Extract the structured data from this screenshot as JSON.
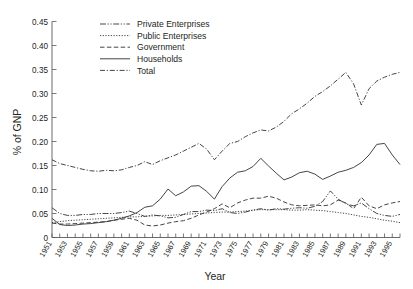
{
  "chart_data": {
    "type": "line",
    "title": "",
    "xlabel": "Year",
    "ylabel": "% of GNP",
    "xlim": [
      1951,
      1996
    ],
    "ylim": [
      0,
      0.45
    ],
    "grid": false,
    "legend_position": "top-left",
    "ytick_labels": [
      "0",
      "0.05",
      "0.10",
      "0.15",
      "0.20",
      "0.25",
      "0.30",
      "0.35",
      "0.40",
      "0.45"
    ],
    "ytick_values": [
      0,
      0.05,
      0.1,
      0.15,
      0.2,
      0.25,
      0.3,
      0.35,
      0.4,
      0.45
    ],
    "xtick_labels": [
      "1951",
      "1953",
      "1955",
      "1957",
      "1959",
      "1961",
      "1963",
      "1965",
      "1967",
      "1969",
      "1971",
      "1973",
      "1975",
      "1977",
      "1979",
      "1981",
      "1983",
      "1985",
      "1987",
      "1989",
      "1991",
      "1993",
      "1995"
    ],
    "xtick_values": [
      1951,
      1953,
      1955,
      1957,
      1959,
      1961,
      1963,
      1965,
      1967,
      1969,
      1971,
      1973,
      1975,
      1977,
      1979,
      1981,
      1983,
      1985,
      1987,
      1989,
      1991,
      1993,
      1995
    ],
    "x": [
      1951,
      1952,
      1953,
      1954,
      1955,
      1956,
      1957,
      1958,
      1959,
      1960,
      1961,
      1962,
      1963,
      1964,
      1965,
      1966,
      1967,
      1968,
      1969,
      1970,
      1971,
      1972,
      1973,
      1974,
      1975,
      1976,
      1977,
      1978,
      1979,
      1980,
      1981,
      1982,
      1983,
      1984,
      1985,
      1986,
      1987,
      1988,
      1989,
      1990,
      1991,
      1992,
      1993,
      1994,
      1995,
      1996
    ],
    "series": [
      {
        "name": "Private Enterprises",
        "dash": "6,1.6,1.2,1.6,1.2,1.6",
        "values": [
          0.062,
          0.05,
          0.046,
          0.046,
          0.048,
          0.048,
          0.05,
          0.05,
          0.05,
          0.052,
          0.055,
          0.05,
          0.044,
          0.047,
          0.045,
          0.041,
          0.042,
          0.048,
          0.054,
          0.054,
          0.057,
          0.056,
          0.06,
          0.052,
          0.05,
          0.053,
          0.057,
          0.06,
          0.057,
          0.06,
          0.059,
          0.061,
          0.062,
          0.061,
          0.065,
          0.075,
          0.097,
          0.08,
          0.07,
          0.066,
          0.072,
          0.06,
          0.05,
          0.046,
          0.044,
          0.048
        ]
      },
      {
        "name": "Public Enterprises",
        "dash": "1.2,1.5",
        "values": [
          0.031,
          0.033,
          0.035,
          0.036,
          0.037,
          0.038,
          0.039,
          0.04,
          0.041,
          0.042,
          0.043,
          0.043,
          0.044,
          0.045,
          0.046,
          0.046,
          0.047,
          0.048,
          0.049,
          0.05,
          0.051,
          0.052,
          0.053,
          0.053,
          0.054,
          0.055,
          0.057,
          0.058,
          0.058,
          0.058,
          0.058,
          0.057,
          0.057,
          0.058,
          0.057,
          0.056,
          0.054,
          0.052,
          0.05,
          0.047,
          0.044,
          0.042,
          0.039,
          0.036,
          0.034,
          0.031
        ]
      },
      {
        "name": "Government",
        "dash": "4.5,2.4",
        "values": [
          0.03,
          0.028,
          0.028,
          0.029,
          0.03,
          0.031,
          0.032,
          0.033,
          0.036,
          0.038,
          0.04,
          0.036,
          0.026,
          0.024,
          0.026,
          0.03,
          0.033,
          0.035,
          0.04,
          0.047,
          0.053,
          0.06,
          0.07,
          0.062,
          0.072,
          0.078,
          0.082,
          0.082,
          0.086,
          0.082,
          0.074,
          0.068,
          0.066,
          0.067,
          0.068,
          0.066,
          0.068,
          0.078,
          0.072,
          0.06,
          0.084,
          0.066,
          0.06,
          0.068,
          0.072,
          0.075
        ]
      },
      {
        "name": "Households",
        "dash": "",
        "values": [
          0.04,
          0.027,
          0.025,
          0.026,
          0.028,
          0.029,
          0.031,
          0.033,
          0.036,
          0.04,
          0.045,
          0.052,
          0.063,
          0.066,
          0.08,
          0.101,
          0.087,
          0.095,
          0.107,
          0.108,
          0.096,
          0.08,
          0.106,
          0.124,
          0.136,
          0.139,
          0.148,
          0.165,
          0.149,
          0.134,
          0.12,
          0.126,
          0.135,
          0.138,
          0.132,
          0.121,
          0.128,
          0.136,
          0.14,
          0.146,
          0.156,
          0.172,
          0.194,
          0.196,
          0.172,
          0.152
        ]
      },
      {
        "name": "Total",
        "dash": "5,1.8,1.2,1.8",
        "values": [
          0.162,
          0.154,
          0.15,
          0.146,
          0.142,
          0.139,
          0.138,
          0.14,
          0.139,
          0.141,
          0.146,
          0.15,
          0.158,
          0.152,
          0.16,
          0.166,
          0.172,
          0.18,
          0.188,
          0.196,
          0.184,
          0.162,
          0.18,
          0.196,
          0.2,
          0.21,
          0.218,
          0.224,
          0.222,
          0.23,
          0.242,
          0.258,
          0.268,
          0.28,
          0.294,
          0.304,
          0.316,
          0.33,
          0.344,
          0.32,
          0.276,
          0.31,
          0.326,
          0.334,
          0.34,
          0.344
        ]
      }
    ],
    "series_total_full": [
      0.162,
      0.154,
      0.15,
      0.146,
      0.142,
      0.139,
      0.138,
      0.14,
      0.139,
      0.141,
      0.146,
      0.15,
      0.158,
      0.152,
      0.16,
      0.166,
      0.172,
      0.18,
      0.188,
      0.196,
      0.184,
      0.162,
      0.18,
      0.196,
      0.2,
      0.21,
      0.218,
      0.224,
      0.222,
      0.23,
      0.242,
      0.258,
      0.268,
      0.28,
      0.294,
      0.304,
      0.316,
      0.33,
      0.344,
      0.32,
      0.276,
      0.31,
      0.326,
      0.334,
      0.34,
      0.344
    ]
  },
  "legend": {
    "items": [
      {
        "label": "Private Enterprises"
      },
      {
        "label": "Public Enterprises"
      },
      {
        "label": "Government"
      },
      {
        "label": "Households"
      },
      {
        "label": "Total"
      }
    ]
  },
  "axes": {
    "y_title": "% of GNP",
    "x_title": "Year"
  }
}
